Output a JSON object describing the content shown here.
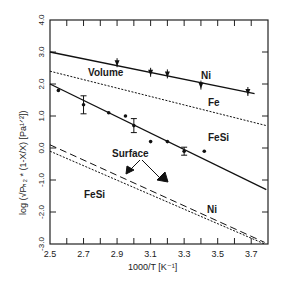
{
  "chart_data": {
    "type": "line",
    "title": "",
    "xlabel": "1000/T  [K⁻¹]",
    "ylabel": "log (√P_H2 * (1-X/X)  [Pa^1/2])",
    "xlim": [
      2.5,
      3.8
    ],
    "ylim": [
      -3.0,
      4.0
    ],
    "x_ticks": [
      "2.5",
      "2.7",
      "2.9",
      "3.1",
      "3.3",
      "3.5",
      "3.7"
    ],
    "y_ticks": [
      "-3.0",
      "-2.0",
      "-1.0",
      "0.0",
      "1.0",
      "2.0",
      "3.0",
      "4.0"
    ],
    "grid": false,
    "annotations": [
      "Volume",
      "Surface",
      "Ni",
      "Fe",
      "FeSi",
      "FeSi",
      "Ni"
    ],
    "series": [
      {
        "name": "Ni (Volume)",
        "style": "solid",
        "line": [
          [
            2.5,
            3.0
          ],
          [
            3.72,
            1.7
          ]
        ],
        "points": [
          [
            2.9,
            2.65
          ],
          [
            3.1,
            2.35
          ],
          [
            3.2,
            2.3
          ],
          [
            3.4,
            1.95
          ],
          [
            3.68,
            1.75
          ]
        ]
      },
      {
        "name": "Fe (Volume)",
        "style": "dotted",
        "line": [
          [
            2.5,
            2.4
          ],
          [
            3.79,
            0.7
          ]
        ],
        "points": []
      },
      {
        "name": "FeSi (Volume)",
        "style": "solid",
        "line": [
          [
            2.5,
            2.0
          ],
          [
            3.79,
            -1.3
          ]
        ],
        "points": [
          [
            2.55,
            1.8
          ],
          [
            2.7,
            1.35
          ],
          [
            2.85,
            1.1
          ],
          [
            2.95,
            1.0
          ],
          [
            3.0,
            0.7
          ],
          [
            3.1,
            0.2
          ],
          [
            3.2,
            0.2
          ],
          [
            3.3,
            -0.1
          ],
          [
            3.42,
            -0.1
          ]
        ]
      },
      {
        "name": "Ni (Surface)",
        "style": "dashed",
        "line": [
          [
            2.5,
            0.1
          ],
          [
            3.78,
            -2.95
          ]
        ],
        "points": []
      },
      {
        "name": "FeSi (Surface)",
        "style": "dotted",
        "line": [
          [
            2.5,
            -0.1
          ],
          [
            3.78,
            -3.0
          ]
        ],
        "points": []
      }
    ]
  },
  "labels": {
    "volume": "Volume",
    "surface": "Surface",
    "ni_top": "Ni",
    "fe": "Fe",
    "fesi_top": "FeSi",
    "fesi_bottom": "FeSi",
    "ni_bottom": "Ni",
    "xlabel": "1000/T  [K⁻¹]",
    "ylabel": "log (√Pₕ₂ * (1-X/X)  [Pa¹ᐟ²])"
  }
}
